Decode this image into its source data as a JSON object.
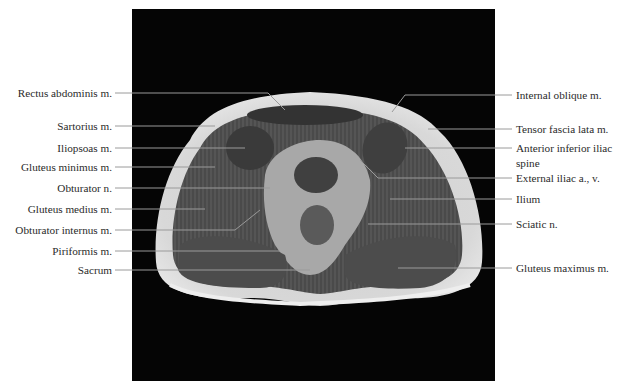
{
  "figure": {
    "type": "axial MRI cross-section of pelvis",
    "frame_color": "#050505",
    "leader_color": "#9a9a9a",
    "labels_left": [
      {
        "text": "Rectus abdominis m.",
        "y": 93
      },
      {
        "text": "Sartorius m.",
        "y": 126
      },
      {
        "text": "Iliopsoas m.",
        "y": 148
      },
      {
        "text": "Gluteus minimus m.",
        "y": 167
      },
      {
        "text": "Obturator n.",
        "y": 188
      },
      {
        "text": "Gluteus medius m.",
        "y": 209
      },
      {
        "text": "Obturator internus m.",
        "y": 230
      },
      {
        "text": "Piriformis m.",
        "y": 251
      },
      {
        "text": "Sacrum",
        "y": 270
      }
    ],
    "labels_right": [
      {
        "text": "Internal oblique m.",
        "y": 95
      },
      {
        "text": "Tensor fascia lata m.",
        "y": 129
      },
      {
        "text": "Anterior inferior iliac",
        "y": 148
      },
      {
        "text": "spine",
        "y": 163
      },
      {
        "text": "External iliac a., v.",
        "y": 178
      },
      {
        "text": "Ilium",
        "y": 199
      },
      {
        "text": "Sciatic n.",
        "y": 224
      },
      {
        "text": "Gluteus maximus m.",
        "y": 268
      }
    ]
  }
}
